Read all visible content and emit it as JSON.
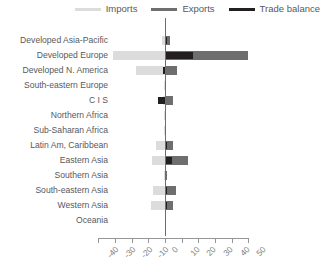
{
  "legend": {
    "items": [
      {
        "label": "Imports",
        "color": "#dcdcdc",
        "key": "imports"
      },
      {
        "label": "Exports",
        "color": "#6e6e6e",
        "key": "exports"
      },
      {
        "label": "Trade balance",
        "color": "#231f20",
        "key": "balance"
      }
    ]
  },
  "chart_data": {
    "type": "bar",
    "orientation": "horizontal",
    "title": "",
    "xlabel": "",
    "ylabel": "",
    "xlim": [
      -40,
      50
    ],
    "xticks": [
      -40,
      -30,
      -20,
      -10,
      0,
      10,
      20,
      30,
      40,
      50
    ],
    "xticklabels": [
      "-40",
      "-30",
      "-20",
      "-10",
      "0",
      "10",
      "20",
      "30",
      "40",
      "50"
    ],
    "grid": false,
    "legend_position": "top-right",
    "categories": [
      "Developed Asia-Pacific",
      "Developed Europe",
      "Developed N. America",
      "South-eastern Europe",
      "C I S",
      "Northern Africa",
      "Sub-Saharan Africa",
      "Latin Am, Caribbean",
      "Eastern Asia",
      "Southern Asia",
      "South-eastern Asia",
      "Western Asia",
      "Oceania"
    ],
    "series": [
      {
        "name": "Imports",
        "color": "#dcdcdc",
        "values": [
          -2.0,
          -31.0,
          -17.5,
          -0.5,
          -1.0,
          -0.5,
          -0.6,
          -5.5,
          -8.0,
          -0.8,
          -7.5,
          -8.5,
          -0.3
        ]
      },
      {
        "name": "Exports",
        "color": "#6e6e6e",
        "values": [
          3.0,
          50.0,
          7.0,
          0.6,
          5.0,
          0.6,
          0.8,
          5.0,
          14.0,
          1.0,
          6.5,
          5.0,
          0.3
        ]
      },
      {
        "name": "Trade balance",
        "color": "#231f20",
        "values": [
          1.5,
          17.0,
          -1.0,
          0.2,
          -4.0,
          0.2,
          0.3,
          1.0,
          4.0,
          0.4,
          1.5,
          1.5,
          0.1
        ]
      }
    ]
  },
  "axis_geometry": {
    "zero_x_px": 165,
    "px_per_unit": 1.665,
    "plot_top_px": 22,
    "row_height_px": 15.0
  }
}
